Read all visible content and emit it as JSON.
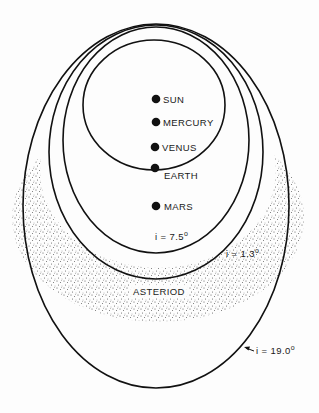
{
  "diagram": {
    "type": "orbital diagram",
    "bodies": [
      {
        "name": "SUN",
        "x": 156,
        "y": 99
      },
      {
        "name": "MERCURY",
        "x": 156,
        "y": 122
      },
      {
        "name": "VENUS",
        "x": 155,
        "y": 147
      },
      {
        "name": "EARTH",
        "x": 155,
        "y": 168
      },
      {
        "name": "MARS",
        "x": 156,
        "y": 206
      }
    ],
    "orbits": [
      {
        "label": "Earth orbit",
        "cx": 154,
        "cy": 105,
        "rx": 71,
        "ry": 65
      },
      {
        "label": "i = 7.5°",
        "inclination": "7.5",
        "cx": 156,
        "cy": 140,
        "rx": 93,
        "ry": 113
      },
      {
        "label": "i = 1.3°",
        "inclination": "1.3",
        "cx": 156,
        "cy": 152,
        "rx": 107,
        "ry": 127
      },
      {
        "label": "i = 19.0°",
        "inclination": "19.0",
        "cx": 156,
        "cy": 206,
        "rx": 133,
        "ry": 182
      }
    ],
    "labels": {
      "sun": "SUN",
      "mercury": "MERCURY",
      "venus": "VENUS",
      "earth": "EARTH",
      "mars": "MARS",
      "asteroid": "ASTERIOD",
      "inc_75": "i = 7.5",
      "inc_13": "i = 1.3",
      "inc_190": "i = 19.0",
      "degree": "o"
    },
    "colors": {
      "ink": "#111111",
      "stipple": "#333333",
      "background": "#fdfdfd"
    }
  }
}
